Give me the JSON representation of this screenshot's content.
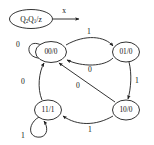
{
  "diagram": {
    "type": "state-machine",
    "legend": {
      "state_format_prefix": "Q",
      "state_format_sub1": "2",
      "state_format_mid": "Q",
      "state_format_sub2": "1",
      "state_format_suffix": "/z",
      "input_label": "x"
    },
    "states": [
      {
        "id": "s00",
        "label": "00/0",
        "cx": 51,
        "cy": 52,
        "rx": 15.5,
        "ry": 10.5
      },
      {
        "id": "s01",
        "label": "01/0",
        "cx": 126,
        "cy": 52,
        "rx": 13.5,
        "ry": 10.0
      },
      {
        "id": "s10",
        "label": "10/0",
        "cx": 126,
        "cy": 110,
        "rx": 13.5,
        "ry": 10.0
      },
      {
        "id": "s11",
        "label": "11/1",
        "cx": 48,
        "cy": 110,
        "rx": 13.5,
        "ry": 10.0
      }
    ],
    "transitions": [
      {
        "id": "t1",
        "from": "s00",
        "to": "s00",
        "label": "0",
        "label_x": 18,
        "label_y": 45,
        "kind": "self-loop"
      },
      {
        "id": "t2",
        "from": "s00",
        "to": "s01",
        "label": "1",
        "label_x": 89,
        "label_y": 33,
        "kind": "curve"
      },
      {
        "id": "t3",
        "from": "s01",
        "to": "s00",
        "label": "0",
        "label_x": 89,
        "label_y": 70,
        "kind": "curve"
      },
      {
        "id": "t4",
        "from": "s01",
        "to": "s10",
        "label": "1",
        "label_x": 135,
        "label_y": 82,
        "kind": "curve"
      },
      {
        "id": "t5",
        "from": "s10",
        "to": "s00",
        "label": "0",
        "label_x": 79,
        "label_y": 86,
        "kind": "diagonal"
      },
      {
        "id": "t6",
        "from": "s10",
        "to": "s11",
        "label": "1",
        "label_x": 89,
        "label_y": 130,
        "kind": "curve"
      },
      {
        "id": "t7",
        "from": "s11",
        "to": "s11",
        "label": "1",
        "label_x": 24,
        "label_y": 136,
        "kind": "self-loop"
      },
      {
        "id": "t8",
        "from": "s11",
        "to": "s00",
        "label": "0",
        "label_x": 24,
        "label_y": 82,
        "kind": "curve"
      }
    ]
  }
}
